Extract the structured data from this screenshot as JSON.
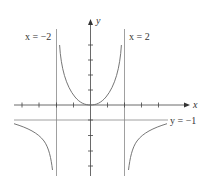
{
  "diagram": {
    "type": "function-graph",
    "function": "y = x^2 / (4 - x^2)",
    "axes": {
      "x_label": "x",
      "y_label": "y"
    },
    "asymptotes": {
      "left_vertical_label": "x = −2",
      "right_vertical_label": "x = 2",
      "horizontal_label": "y = −1"
    },
    "x_ticks": [
      -5,
      -4,
      -3,
      -2,
      -1,
      1,
      2,
      3,
      4
    ],
    "y_ticks": [
      -4,
      -3,
      -2,
      -1,
      1,
      2,
      3,
      4
    ],
    "colors": {
      "axis": "#444444",
      "curve": "#666666",
      "asymptote": "#888888",
      "background": "#ffffff"
    }
  }
}
